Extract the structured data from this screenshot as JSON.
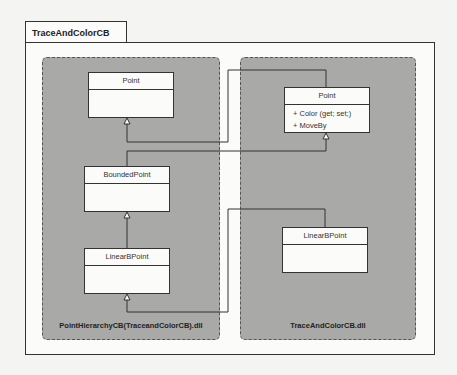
{
  "package": {
    "name": "TraceAndColorCB"
  },
  "assemblies": [
    {
      "label": "PointHierarchyCB(TraceandColorCB).dll",
      "classes": [
        {
          "name": "Point",
          "members": []
        },
        {
          "name": "BoundedPoint",
          "members": []
        },
        {
          "name": "LinearBPoint",
          "members": []
        }
      ]
    },
    {
      "label": "TraceAndColorCB.dll",
      "classes": [
        {
          "name": "Point",
          "members": [
            "+ Color (get; set;)",
            "+ MoveBy"
          ]
        },
        {
          "name": "LinearBPoint",
          "members": []
        }
      ]
    }
  ],
  "relationships": [
    {
      "from": "TraceAndColorCB.dll/Point",
      "to": "PointHierarchyCB/Point",
      "type": "inheritance"
    },
    {
      "from": "PointHierarchyCB/BoundedPoint",
      "to": "TraceAndColorCB.dll/Point",
      "type": "inheritance"
    },
    {
      "from": "PointHierarchyCB/LinearBPoint",
      "to": "PointHierarchyCB/BoundedPoint",
      "type": "inheritance"
    },
    {
      "from": "TraceAndColorCB.dll/LinearBPoint",
      "to": "PointHierarchyCB/LinearBPoint",
      "type": "inheritance"
    }
  ],
  "colors": {
    "assembly_fill": "#a9a9a7",
    "class_fill": "#fbfbf9",
    "line": "#333333"
  }
}
